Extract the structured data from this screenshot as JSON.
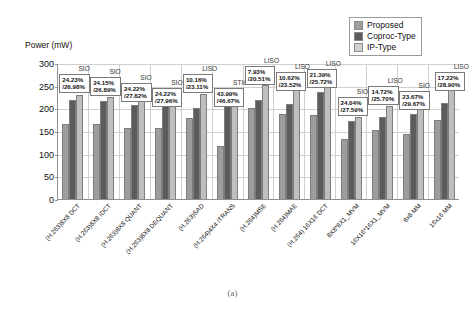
{
  "chart_data": {
    "type": "bar",
    "title": "",
    "xlabel": "",
    "ylabel": "Power (mW)",
    "ylim": [
      0,
      300
    ],
    "yticks": [
      0,
      50,
      100,
      150,
      200,
      250,
      300
    ],
    "grid": true,
    "legend_position": "top-right",
    "categories": [
      "(H.263)8X8 DCT",
      "(H.263)8X8 IDCT",
      "(H.263)8X8 QUANT",
      "(H.263)8X8 DEQUANT",
      "(H.263)SAD",
      "(H.264)4X4 ITRANS",
      "(H.264)MSE",
      "(H.264)MAE",
      "(H.264) 16X16 DCT",
      "8X8*8X1_MVM",
      "16X16*16X1_MVM",
      "8x8 MM",
      "16x16 MM"
    ],
    "series": [
      {
        "name": "Proposed",
        "color": "#9d9d9d",
        "values": [
          166,
          165,
          157,
          156,
          179,
          116,
          201,
          187,
          185,
          132,
          152,
          144,
          174
        ]
      },
      {
        "name": "Coproc-Type",
        "color": "#5c5c5c",
        "values": [
          219,
          217,
          208,
          205,
          201,
          205,
          218,
          209,
          236,
          172,
          180,
          188,
          211
        ]
      },
      {
        "name": "IP-Type",
        "color": "#bfbfbf",
        "values": [
          229,
          226,
          218,
          216,
          231,
          215,
          251,
          243,
          248,
          181,
          206,
          205,
          242
        ]
      }
    ],
    "annotations": [
      {
        "type": "SIO",
        "reduction_vs_coproc": "24.23%",
        "reduction_vs_ip": "/26.98%"
      },
      {
        "type": "SIO",
        "reduction_vs_coproc": "24.15%",
        "reduction_vs_ip": "/26.89%"
      },
      {
        "type": "SIO",
        "reduction_vs_coproc": "24.22%",
        "reduction_vs_ip": "/27.82%"
      },
      {
        "type": "SIO",
        "reduction_vs_coproc": "24.22%",
        "reduction_vs_ip": "/27.96%"
      },
      {
        "type": "LISO",
        "reduction_vs_coproc": "10.16%",
        "reduction_vs_ip": "/23.11%"
      },
      {
        "type": "STIO",
        "reduction_vs_coproc": "43.99%",
        "reduction_vs_ip": "/46.67%"
      },
      {
        "type": "LISO",
        "reduction_vs_coproc": "7.93%",
        "reduction_vs_ip": "/20.51%"
      },
      {
        "type": "LISO",
        "reduction_vs_coproc": "10.62%",
        "reduction_vs_ip": "/23.52%"
      },
      {
        "type": "LISO",
        "reduction_vs_coproc": "21.39%",
        "reduction_vs_ip": "/25.72%"
      },
      {
        "type": "SIO",
        "reduction_vs_coproc": "24.04%",
        "reduction_vs_ip": "/27.59%"
      },
      {
        "type": "LISO",
        "reduction_vs_coproc": "14.72%",
        "reduction_vs_ip": "/25.70%"
      },
      {
        "type": "SIO",
        "reduction_vs_coproc": "23.67%",
        "reduction_vs_ip": "/29.67%"
      },
      {
        "type": "LISO",
        "reduction_vs_coproc": "17.22%",
        "reduction_vs_ip": "/28.90%"
      }
    ]
  },
  "caption": "(a)"
}
